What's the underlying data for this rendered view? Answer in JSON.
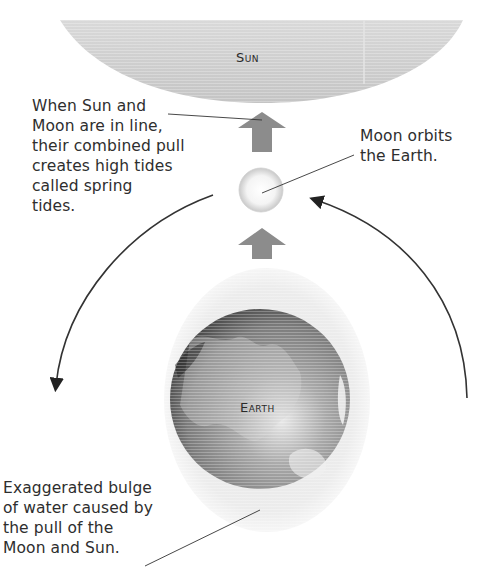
{
  "diagram": {
    "type": "spring-tides",
    "bodies": {
      "sun": {
        "label": "Sun",
        "color": "#cdcdcd"
      },
      "moon": {
        "label": "Moon",
        "color": "#f2f2f2"
      },
      "earth": {
        "label": "Earth",
        "color": "#7a7a7a"
      },
      "bulge": {
        "color": "#e9e9e9"
      }
    },
    "arrows": {
      "pull_color": "#8c8c8c",
      "orbit_color": "#333333"
    },
    "callouts": {
      "spring_tides": "When Sun and\nMoon are in line,\ntheir combined pull\ncreates high tides\ncalled spring\ntides.",
      "moon_orbit": "Moon orbits\nthe Earth.",
      "bulge": "Exaggerated bulge\nof water caused by\nthe pull of the\nMoon and Sun."
    }
  }
}
